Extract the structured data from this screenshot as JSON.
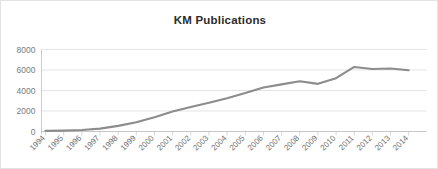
{
  "chart_data": {
    "type": "line",
    "title": "KM Publications",
    "xlabel": "",
    "ylabel": "",
    "categories": [
      "1994",
      "1995",
      "1996",
      "1997",
      "1998",
      "1999",
      "2000",
      "2001",
      "2002",
      "2003",
      "2004",
      "2005",
      "2006",
      "2007",
      "2008",
      "2009",
      "2010",
      "2011",
      "2012",
      "2013",
      "2014"
    ],
    "series": [
      {
        "name": "KM Publications",
        "values": [
          60,
          90,
          150,
          280,
          550,
          900,
          1400,
          1950,
          2400,
          2800,
          3250,
          3750,
          4300,
          4600,
          4900,
          4650,
          5200,
          6300,
          6100,
          6150,
          5980
        ],
        "color": "#8c8c8c"
      }
    ],
    "ylim": [
      0,
      8000
    ],
    "yticks": [
      0,
      2000,
      4000,
      6000,
      8000
    ],
    "ytick_labels": [
      "0",
      "2000",
      "4000",
      "6000",
      "8000"
    ],
    "grid": true,
    "grid_axis": "y",
    "legend": false,
    "legend_position": "none",
    "xtick_rotation": -45,
    "background": "#ffffff",
    "border_color": "#e3e3e3",
    "gridline_color": "#d9d9d9",
    "axis_color": "#bfbfbf"
  }
}
